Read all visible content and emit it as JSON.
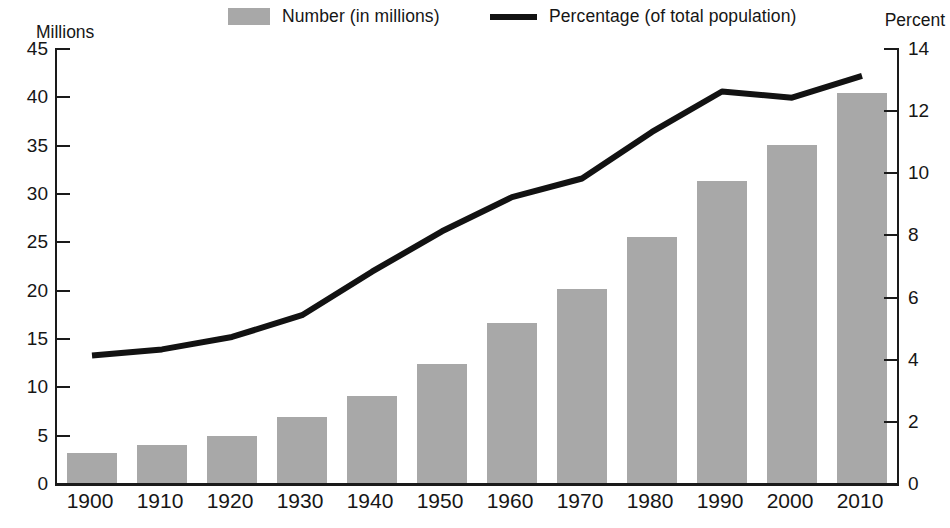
{
  "legend": {
    "number_label": "Number (in millions)",
    "percentage_label": "Percentage (of total population)",
    "swatch_color": "#a8a8a8",
    "line_color": "#121212"
  },
  "axis_titles": {
    "left": "Millions",
    "right": "Percent"
  },
  "chart_data": {
    "type": "bar",
    "title": "",
    "subtitle": "",
    "xlabel": "",
    "ylabel": "Millions",
    "y2label": "Percent",
    "categories": [
      "1900",
      "1910",
      "1920",
      "1930",
      "1940",
      "1950",
      "1960",
      "1970",
      "1980",
      "1990",
      "2000",
      "2010"
    ],
    "ylim": [
      0,
      45
    ],
    "y2lim": [
      0,
      14
    ],
    "yticks": [
      "0",
      "5",
      "10",
      "15",
      "20",
      "25",
      "30",
      "35",
      "40",
      "45"
    ],
    "y2ticks": [
      "0",
      "2",
      "4",
      "6",
      "8",
      "10",
      "12",
      "14"
    ],
    "grid": false,
    "legend_position": "top",
    "series": [
      {
        "name": "Number (in millions)",
        "type": "bar",
        "axis": "left",
        "color": "#a8a8a8",
        "values": [
          3.1,
          3.9,
          4.9,
          6.8,
          9.0,
          12.3,
          16.6,
          20.1,
          25.5,
          31.2,
          35.0,
          40.3
        ]
      },
      {
        "name": "Percentage (of total population)",
        "type": "line",
        "axis": "right",
        "color": "#121212",
        "values": [
          4.1,
          4.3,
          4.7,
          5.4,
          6.8,
          8.1,
          9.2,
          9.8,
          11.3,
          12.6,
          12.4,
          13.1
        ]
      }
    ]
  }
}
